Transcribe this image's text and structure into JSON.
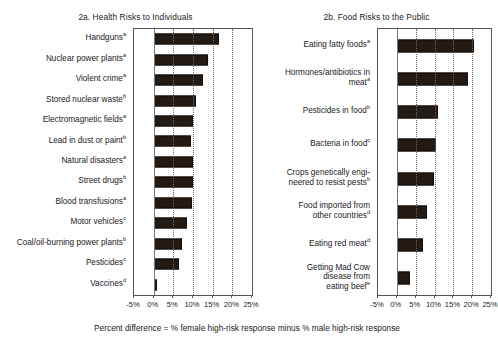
{
  "figure": {
    "footnote": "Percent difference = % female high-risk response minus % male high-risk response"
  },
  "chart_data": [
    {
      "type": "bar",
      "orientation": "horizontal",
      "id": "panel-2a",
      "title": "2a. Health Risks to Individuals",
      "xlabel": "Percent difference = % female high-risk response minus % male high-risk response",
      "ylabel": "",
      "xlim": [
        -5,
        25
      ],
      "xticks": [
        -5,
        0,
        5,
        10,
        15,
        20,
        25
      ],
      "xticklabels": [
        "-5%",
        "0%",
        "5%",
        "10%",
        "15%",
        "20%",
        "25%"
      ],
      "grid": "vertical dotted at 5,10,15,20; solid zero line at 0",
      "legend": "none",
      "categories": [
        "Handguns",
        "Nuclear power plants",
        "Violent crime",
        "Stored nuclear waste",
        "Electromagnetic fields",
        "Lead in dust or paint",
        "Natural disasters",
        "Street drugs",
        "Blood transfusions",
        "Motor vehicles",
        "Coal/oil-burning power plants",
        "Pesticides",
        "Vaccines"
      ],
      "category_footnote_marks": [
        "a",
        "a",
        "a",
        "b",
        "a",
        "b",
        "a",
        "b",
        "a",
        "c",
        "b",
        "c",
        "d"
      ],
      "values": [
        16.6,
        13.7,
        12.5,
        10.8,
        10.0,
        9.5,
        10.0,
        10.0,
        9.7,
        8.4,
        7.1,
        6.5,
        0.9
      ]
    },
    {
      "type": "bar",
      "orientation": "horizontal",
      "id": "panel-2b",
      "title": "2b. Food Risks to the Public",
      "xlabel": "Percent difference = % female high-risk response minus % male high-risk response",
      "ylabel": "",
      "xlim": [
        -5,
        25
      ],
      "xticks": [
        -5,
        0,
        5,
        10,
        15,
        20,
        25
      ],
      "xticklabels": [
        "-5%",
        "0%",
        "5%",
        "10%",
        "15%",
        "20%",
        "25%"
      ],
      "grid": "vertical dotted at 5,10,15,20; solid zero line at 0",
      "legend": "none",
      "categories": [
        "Eating fatty foods",
        "Hormones/antibiotics in\nmeat",
        "Pesticides in food",
        "Bacteria in food",
        "Crops genetically engi-\nneered to resist pests",
        "Food imported from\nother countries",
        "Eating red meat",
        "Getting Mad Cow\ndisease from\neating beef"
      ],
      "category_footnote_marks": [
        "a",
        "a",
        "b",
        "c",
        "b",
        "d",
        "d",
        "e"
      ],
      "values": [
        20.5,
        19.0,
        11.0,
        10.5,
        10.0,
        8.0,
        7.0,
        3.5
      ]
    }
  ]
}
